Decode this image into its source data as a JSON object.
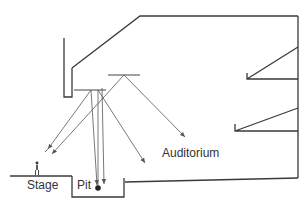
{
  "diagram": {
    "title": "",
    "labels": {
      "stage": "Stage",
      "pit": "Pit",
      "auditorium": "Auditorium"
    },
    "elements": [
      {
        "id": "proscenium-wall",
        "kind": "wall"
      },
      {
        "id": "ceiling",
        "kind": "wall"
      },
      {
        "id": "rear-wall",
        "kind": "wall"
      },
      {
        "id": "upper-balcony",
        "kind": "balcony"
      },
      {
        "id": "lower-balcony",
        "kind": "balcony"
      },
      {
        "id": "stage-floor",
        "kind": "floor"
      },
      {
        "id": "orchestra-pit",
        "kind": "pit"
      },
      {
        "id": "auditorium-floor",
        "kind": "floor"
      },
      {
        "id": "reflector-front",
        "kind": "overhead-reflector"
      },
      {
        "id": "reflector-rear",
        "kind": "overhead-reflector"
      },
      {
        "id": "performer-figure",
        "kind": "source"
      },
      {
        "id": "pit-source",
        "kind": "source"
      }
    ],
    "colors": {
      "line": "#3a3a3a",
      "ray": "#555555",
      "text": "#333333",
      "background": "#ffffff"
    }
  }
}
